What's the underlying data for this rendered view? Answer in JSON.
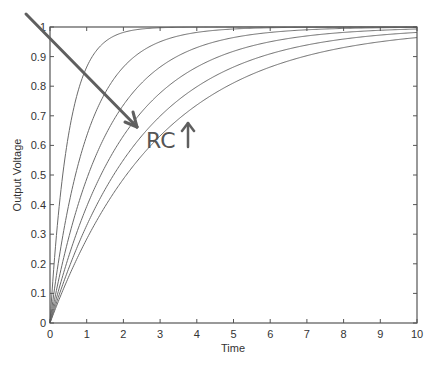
{
  "chart_data": {
    "type": "line",
    "title": "",
    "xlabel": "Time",
    "ylabel": "Output Voltage",
    "xlim": [
      0,
      10
    ],
    "ylim": [
      0,
      1
    ],
    "grid": false,
    "legend": null,
    "xticks": [
      "0",
      "1",
      "2",
      "3",
      "4",
      "5",
      "6",
      "7",
      "8",
      "9",
      "10"
    ],
    "yticks": [
      "0",
      "0.1",
      "0.2",
      "0.3",
      "0.4",
      "0.5",
      "0.6",
      "0.7",
      "0.8",
      "0.9",
      "1"
    ],
    "function": "V(t) = 1 - exp(-t/RC)",
    "series": [
      {
        "name": "RC=0.5",
        "rc": 0.5
      },
      {
        "name": "RC=1",
        "rc": 1.0
      },
      {
        "name": "RC=1.5",
        "rc": 1.5
      },
      {
        "name": "RC=2",
        "rc": 2.0
      },
      {
        "name": "RC=2.5",
        "rc": 2.5
      },
      {
        "name": "RC=3",
        "rc": 3.0
      }
    ],
    "annotations": [
      {
        "text": "RC ↑",
        "type": "handwritten",
        "note": "arrow pointing across curves toward increasing RC"
      }
    ]
  },
  "annotation": {
    "rc_text": "RC",
    "up_arrow": "↑"
  },
  "colors": {
    "curve": "#6a6a6a",
    "axis": "#555555",
    "annotation": "#5a5a5a"
  }
}
